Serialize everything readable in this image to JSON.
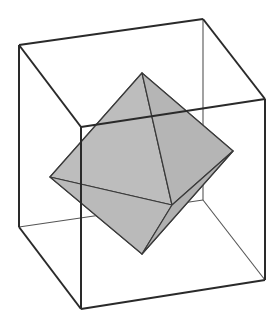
{
  "figure": {
    "colors": {
      "background": "#ffffff",
      "edge": "#2a2a2a",
      "thin_edge": "#555555",
      "fill": "#b8b8b8",
      "fill_edge": "#3a3a3a"
    },
    "cube": {
      "vertices": {
        "top_left": [
          19,
          45
        ],
        "top_back": [
          203,
          19
        ],
        "top_right": [
          265,
          99
        ],
        "top_front": [
          81,
          127
        ],
        "bottom_left": [
          19,
          227
        ],
        "bottom_back": [
          203,
          200
        ],
        "bottom_right": [
          265,
          280
        ],
        "bottom_front": [
          81,
          309
        ]
      }
    },
    "octahedron": {
      "vertices": {
        "top": [
          142,
          73
        ],
        "left": [
          50,
          177
        ],
        "right": [
          233,
          151
        ],
        "front": [
          172,
          205
        ],
        "bottom": [
          142,
          254
        ]
      }
    }
  }
}
